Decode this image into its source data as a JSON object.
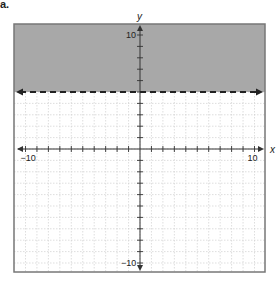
{
  "problem_label": "a.",
  "colors": {
    "shade": "#a8a8a8",
    "frame": "#777777",
    "grid": "#d0d0d0",
    "axis": "#333333",
    "boundary": "#222222"
  },
  "chart_data": {
    "type": "inequality-graph",
    "title": "",
    "xlabel": "x",
    "ylabel": "y",
    "xlim": [
      -10,
      10
    ],
    "ylim": [
      -10,
      10
    ],
    "grid": true,
    "x_tick_labels": [
      "-10",
      "10"
    ],
    "y_tick_labels": [
      "10",
      "-10"
    ],
    "tick_step": 1,
    "boundary": {
      "equation": "y = 5",
      "style": "dashed",
      "y_value": 5
    },
    "shaded_region": "above",
    "inequality": "y > 5"
  },
  "labels": {
    "x_axis": "x",
    "y_axis": "y",
    "x_min": "−10",
    "x_max": "10",
    "y_max": "10",
    "y_min": "−10"
  }
}
